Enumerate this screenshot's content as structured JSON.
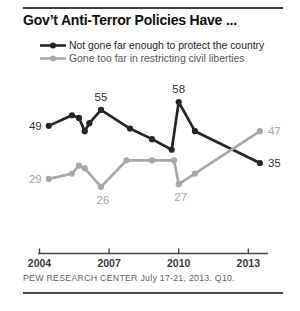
{
  "footer": {
    "source": "PEW RESEARCH CENTER July 17-21, 2013. Q10."
  },
  "chart_data": {
    "type": "line",
    "title": "Gov’t Anti-Terror Policies Have ...",
    "xlabel": "",
    "ylabel": "",
    "grid": false,
    "y_axis_visible": false,
    "ylim": [
      20,
      65
    ],
    "x_axis_range": [
      2004,
      2013.9
    ],
    "axis_color": "#454545",
    "legend_position": "top-left",
    "x_ticks": [
      {
        "label": "2004",
        "year": 2004
      },
      {
        "label": "2007",
        "year": 2007
      },
      {
        "label": "2010",
        "year": 2010
      },
      {
        "label": "2013",
        "year": 2013
      }
    ],
    "series": [
      {
        "name": "Not gone far enough to protect the country",
        "color": "#262424",
        "label_color": "#333333",
        "points": [
          {
            "x": 2004.4,
            "v": 49
          },
          {
            "x": 2005.4,
            "v": 53
          },
          {
            "x": 2005.7,
            "v": 52
          },
          {
            "x": 2005.95,
            "v": 47
          },
          {
            "x": 2006.15,
            "v": 50
          },
          {
            "x": 2006.65,
            "v": 55
          },
          {
            "x": 2007.9,
            "v": 48
          },
          {
            "x": 2008.85,
            "v": 44
          },
          {
            "x": 2009.7,
            "v": 40
          },
          {
            "x": 2010.0,
            "v": 58
          },
          {
            "x": 2010.7,
            "v": 47
          },
          {
            "x": 2013.5,
            "v": 35
          }
        ],
        "labeled_points": [
          {
            "index": 0,
            "pos": "left"
          },
          {
            "index": 5,
            "pos": "above"
          },
          {
            "index": 9,
            "pos": "above"
          },
          {
            "index": 11,
            "pos": "right"
          }
        ]
      },
      {
        "name": "Gone too far in restricting civil liberties",
        "color": "#a9a7a5",
        "label_color": "#a3a3a3",
        "points": [
          {
            "x": 2004.4,
            "v": 29
          },
          {
            "x": 2005.4,
            "v": 31
          },
          {
            "x": 2005.7,
            "v": 34
          },
          {
            "x": 2005.95,
            "v": 33
          },
          {
            "x": 2006.65,
            "v": 26
          },
          {
            "x": 2007.75,
            "v": 36
          },
          {
            "x": 2008.85,
            "v": 36
          },
          {
            "x": 2009.8,
            "v": 36
          },
          {
            "x": 2010.0,
            "v": 27
          },
          {
            "x": 2010.7,
            "v": 31
          },
          {
            "x": 2013.5,
            "v": 47
          }
        ],
        "labeled_points": [
          {
            "index": 0,
            "pos": "left"
          },
          {
            "index": 4,
            "pos": "below"
          },
          {
            "index": 8,
            "pos": "below"
          },
          {
            "index": 10,
            "pos": "right"
          }
        ]
      }
    ]
  }
}
